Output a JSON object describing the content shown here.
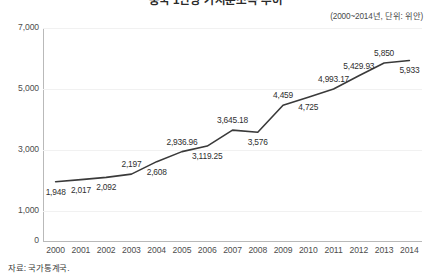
{
  "header": {
    "title": "중국 1인당 가처분소득 추이",
    "subtitle": "(2000~2014년, 단위: 위안)"
  },
  "footer": {
    "source": "자료: 국가통계국."
  },
  "colors": {
    "line": "#3a3a3a",
    "axis": "#b9b9b9",
    "grid": "#f1f1f1",
    "text": "#3b3b3b",
    "background": "#ffffff"
  },
  "chart_data": {
    "type": "line",
    "title": "중국 1인당 가처분소득 추이",
    "subtitle": "(2000~2014년, 단위: 위안)",
    "xlabel": "",
    "ylabel": "",
    "ylim": [
      0,
      7000
    ],
    "y_ticks": [
      0,
      1000,
      3000,
      5000,
      7000
    ],
    "y_tick_labels": [
      "0",
      "1,000",
      "3,000",
      "5,000",
      "7,000"
    ],
    "grid": true,
    "legend": false,
    "categories": [
      "2000",
      "2001",
      "2002",
      "2003",
      "2004",
      "2005",
      "2006",
      "2007",
      "2008",
      "2009",
      "2010",
      "2011",
      "2012",
      "2013",
      "2014"
    ],
    "values": [
      1948,
      2017,
      2092,
      2197,
      2608,
      2936.96,
      3119.25,
      3645.18,
      3576,
      4459,
      4725,
      4993.17,
      5429.93,
      5850,
      5933
    ],
    "point_labels": [
      "1,948",
      "2,017",
      "2,092",
      "2,197",
      "2,608",
      "2,936.96",
      "3,119.25",
      "3,645.18",
      "3,576",
      "4,459",
      "4,725",
      "4,993.17",
      "5,429.93",
      "5,850",
      "5,933"
    ],
    "label_positions": [
      "below",
      "below",
      "below",
      "above",
      "below",
      "above",
      "below",
      "above",
      "below",
      "above",
      "below",
      "above",
      "above",
      "above",
      "below"
    ]
  }
}
